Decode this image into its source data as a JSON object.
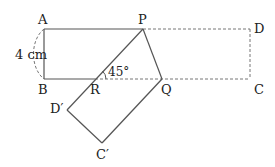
{
  "diagram": {
    "labels": {
      "A": "A",
      "B": "B",
      "P": "P",
      "D": "D",
      "R": "R",
      "Q": "Q",
      "C": "C",
      "D_prime": "D′",
      "C_prime": "C′"
    },
    "side_length": "4 cm",
    "angle": "45°",
    "colors": {
      "line": "#555555",
      "dashed": "#777777",
      "text": "#222222"
    }
  }
}
